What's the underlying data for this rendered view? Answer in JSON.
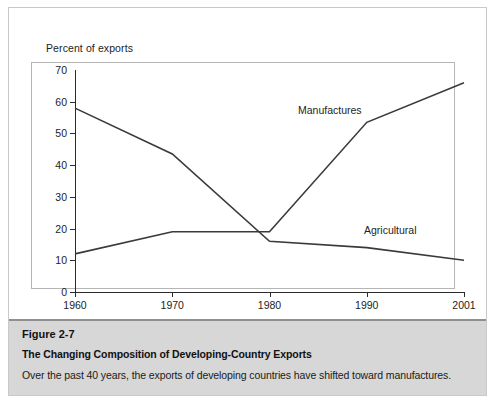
{
  "figure": {
    "number": "Figure 2-7",
    "title": "The Changing Composition of Developing-Country Exports",
    "description": "Over the past 40 years, the exports of developing countries have shifted toward manufactures."
  },
  "chart_data": {
    "type": "line",
    "title": "",
    "ylabel": "Percent of exports",
    "xlabel": "",
    "categories": [
      "1960",
      "1970",
      "1980",
      "1990",
      "2001"
    ],
    "ylim": [
      0,
      70
    ],
    "yticks": [
      0,
      10,
      20,
      30,
      40,
      50,
      60,
      70
    ],
    "ytick_labels": [
      "0",
      "10",
      "20",
      "30",
      "40",
      "50",
      "60",
      "70"
    ],
    "grid": false,
    "legend_position": "inline-annotation",
    "series": [
      {
        "name": "Agricultural",
        "values": [
          58,
          43.5,
          16,
          14,
          10
        ]
      },
      {
        "name": "Manufactures",
        "values": [
          12,
          19,
          19,
          53.5,
          66
        ]
      }
    ],
    "annotations": [
      {
        "text": "Manufactures"
      },
      {
        "text": "Agricultural"
      }
    ]
  },
  "colors": {
    "line": "#3a3a3a",
    "axis": "#2b2b2b",
    "caption_background": "#d7d7d7",
    "panel_background": "#ffffff",
    "frame_border": "#b5b5b5"
  }
}
